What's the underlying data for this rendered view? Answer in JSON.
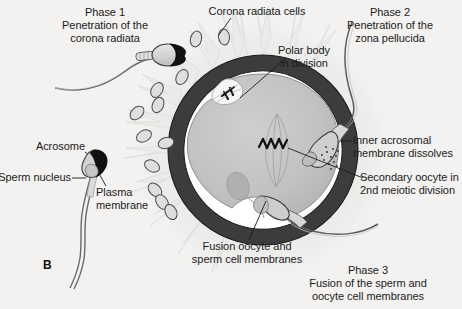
{
  "figure": {
    "panel_letter": "B",
    "background_color": "#f3f2f0",
    "text_color": "#1b1b1b",
    "width": 462,
    "height": 309
  },
  "phases": {
    "phase1": {
      "line1": "Phase 1",
      "line2": "Penetration of the",
      "line3": "corona radiata"
    },
    "phase2": {
      "line1": "Phase 2",
      "line2": "Penetration of the",
      "line3": "zona pellucida"
    },
    "phase3": {
      "line1": "Phase 3",
      "line2": "Fusion of the sperm and",
      "line3": "oocyte cell membranes"
    }
  },
  "labels": {
    "corona_radiata_cells": "Corona radiata cells",
    "polar_body_line1": "Polar body",
    "polar_body_line2": "in division",
    "inner_acrosomal_line1": "Inner acrosomal",
    "inner_acrosomal_line2": "membrane dissolves",
    "secondary_oocyte_line1": "Secondary oocyte in",
    "secondary_oocyte_line2": "2nd meiotic division",
    "fusion_line1": "Fusion oocyte and",
    "fusion_line2": "sperm cell membranes",
    "acrosome": "Acrosome",
    "sperm_nucleus": "Sperm nucleus",
    "plasma_membrane_line1": "Plasma",
    "plasma_membrane_line2": "membrane"
  },
  "colors": {
    "zona_pellucida": "#3c3c3c",
    "perivitelline_space": "#ffffff",
    "cytoplasm": "#c0c0c0",
    "corona_cell_fill": "#dcdcdc",
    "corona_cell_stroke": "#4a4a4a",
    "acrosome_cap": "#121212",
    "sperm_body": "#d4d4d4",
    "leader_line": "#1b1b1b",
    "cumulus_halo": "#e4e4e2"
  },
  "structures": {
    "oocyte_center_x": 263,
    "oocyte_center_y": 150,
    "zona_outer_radius": 95,
    "zona_thickness": 16,
    "sperm_count_outside": 2,
    "corona_cell_count": 12
  }
}
